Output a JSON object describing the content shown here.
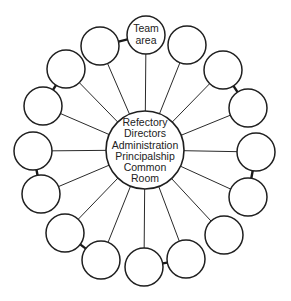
{
  "diagram": {
    "type": "hub-and-spoke",
    "hub": {
      "label_lines": [
        "Refectory",
        "Directors",
        "Administration",
        "Principalship",
        "Common",
        "Room"
      ],
      "cx": 145,
      "cy": 150,
      "r": 39
    },
    "team_node": {
      "label_lines": [
        "Team",
        "area"
      ],
      "cx": 146,
      "cy": 35,
      "r": 19
    },
    "outer_nodes": [
      {
        "cx": 146,
        "cy": 35
      },
      {
        "cx": 187,
        "cy": 45
      },
      {
        "cx": 223,
        "cy": 70
      },
      {
        "cx": 248,
        "cy": 108
      },
      {
        "cx": 256,
        "cy": 152
      },
      {
        "cx": 248,
        "cy": 197
      },
      {
        "cx": 224,
        "cy": 235
      },
      {
        "cx": 186,
        "cy": 259
      },
      {
        "cx": 144,
        "cy": 267
      },
      {
        "cx": 101,
        "cy": 260
      },
      {
        "cx": 65,
        "cy": 233
      },
      {
        "cx": 41,
        "cy": 194
      },
      {
        "cx": 33,
        "cy": 151
      },
      {
        "cx": 43,
        "cy": 106
      },
      {
        "cx": 66,
        "cy": 69
      },
      {
        "cx": 100,
        "cy": 46
      }
    ],
    "node_radius": 19,
    "paired_links": [
      [
        0,
        15
      ],
      [
        2,
        3
      ],
      [
        4,
        5
      ],
      [
        7,
        8
      ],
      [
        9,
        10
      ],
      [
        11,
        12
      ],
      [
        13,
        14
      ]
    ],
    "colors": {
      "stroke": "#1f1f1f",
      "background": "#ffffff"
    }
  }
}
